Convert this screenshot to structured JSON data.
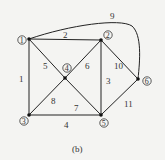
{
  "caption": "(b)",
  "nodes": [
    {
      "id": "1",
      "label": "1",
      "x": 29,
      "y": 39
    },
    {
      "id": "2",
      "label": "2",
      "x": 101,
      "y": 40
    },
    {
      "id": "3",
      "label": "3",
      "x": 29,
      "y": 115
    },
    {
      "id": "4",
      "label": "4",
      "x": 65,
      "y": 78
    },
    {
      "id": "5",
      "label": "5",
      "x": 101,
      "y": 115
    },
    {
      "id": "6",
      "label": "6",
      "x": 138,
      "y": 79
    }
  ],
  "edges": [
    {
      "label": "1",
      "from": "1",
      "to": "3"
    },
    {
      "label": "2",
      "from": "1",
      "to": "2"
    },
    {
      "label": "3",
      "from": "2",
      "to": "5"
    },
    {
      "label": "4",
      "from": "3",
      "to": "5"
    },
    {
      "label": "5",
      "from": "1",
      "to": "4"
    },
    {
      "label": "6",
      "from": "2",
      "to": "4"
    },
    {
      "label": "7",
      "from": "4",
      "to": "5"
    },
    {
      "label": "8",
      "from": "3",
      "to": "4"
    },
    {
      "label": "9",
      "from": "1",
      "to": "6",
      "curved": true
    },
    {
      "label": "10",
      "from": "2",
      "to": "6"
    },
    {
      "label": "11",
      "from": "5",
      "to": "6"
    }
  ]
}
